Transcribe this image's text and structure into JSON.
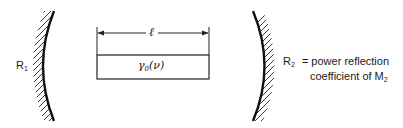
{
  "figure": {
    "mirror_left": {
      "label": "R",
      "subscript": "1"
    },
    "mirror_right": {
      "label": "R",
      "subscript": "2",
      "equals": "=",
      "description_line1": "power reflection",
      "description_line2_prefix": "coefficient of M",
      "description_line2_subscript": "2"
    },
    "gain_medium": {
      "label": "γ",
      "subscript": "0",
      "argument": "(ν)"
    },
    "length_dimension": {
      "label": "ℓ"
    }
  }
}
